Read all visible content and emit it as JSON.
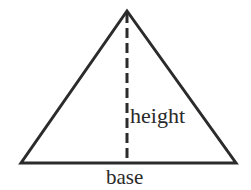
{
  "figure": {
    "name": "triangle-base-height-diagram",
    "type": "geometry-diagram",
    "background_color": "#ffffff",
    "stroke_color": "#2b2b2b",
    "text_color": "#2a2a2a",
    "shape": {
      "name": "triangle",
      "stroke_width": 3,
      "apex": {
        "x": 127,
        "y": 11
      },
      "bottom_left": {
        "x": 21,
        "y": 163
      },
      "bottom_right": {
        "x": 236,
        "y": 163
      }
    },
    "altitude": {
      "name": "height-dashed-line",
      "stroke_width": 3,
      "dash_pattern": "10 5",
      "from": {
        "x": 127,
        "y": 13
      },
      "to": {
        "x": 127,
        "y": 163
      }
    },
    "labels": {
      "height": "height",
      "base": "base"
    }
  }
}
